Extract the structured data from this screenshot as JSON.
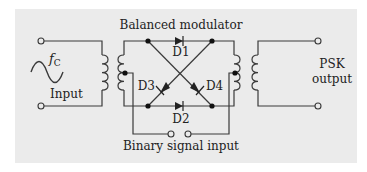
{
  "title": "Balanced modulator",
  "input": {
    "frequency_label": "f",
    "frequency_subscript": "C",
    "label": "Input"
  },
  "output": {
    "label_line1": "PSK",
    "label_line2": "output"
  },
  "control": {
    "label": "Binary signal input"
  },
  "diodes": [
    {
      "id": "D1",
      "label": "D1"
    },
    {
      "id": "D2",
      "label": "D2"
    },
    {
      "id": "D3",
      "label": "D3"
    },
    {
      "id": "D4",
      "label": "D4"
    }
  ],
  "colors": {
    "panel": "#ebebeb",
    "line": "#3a3a3a",
    "text": "#222222"
  }
}
